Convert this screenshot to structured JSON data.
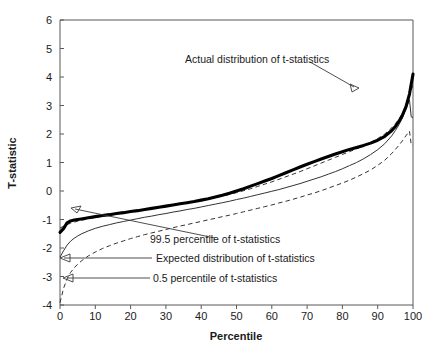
{
  "chart_data": {
    "type": "line",
    "title": "",
    "xlabel": "Percentile",
    "ylabel": "T-statistic",
    "xlim": [
      0,
      100
    ],
    "ylim": [
      -4,
      6
    ],
    "xticks": [
      "0",
      "10",
      "20",
      "30",
      "40",
      "50",
      "60",
      "70",
      "80",
      "90",
      "100"
    ],
    "yticks": [
      "6",
      "5",
      "4",
      "3",
      "2",
      "1",
      "0",
      "-1",
      "-2",
      "-3",
      "-4"
    ],
    "grid": false,
    "legend_position": "inline-annotations",
    "x": [
      0,
      1,
      2,
      3,
      4,
      5,
      6,
      8,
      10,
      12,
      14,
      16,
      18,
      20,
      22,
      24,
      26,
      28,
      30,
      32,
      34,
      36,
      38,
      40,
      42,
      44,
      46,
      48,
      50,
      52,
      54,
      56,
      58,
      60,
      62,
      64,
      66,
      68,
      70,
      72,
      74,
      76,
      78,
      80,
      82,
      84,
      86,
      88,
      90,
      92,
      94,
      95,
      96,
      97,
      98,
      99,
      99.5,
      100
    ],
    "series": [
      {
        "name": "Actual distribution of t-statistics",
        "style": "thick-solid",
        "color": "#000000",
        "values": [
          -1.45,
          -1.32,
          -1.12,
          -1.05,
          -1.02,
          -1.0,
          -0.98,
          -0.94,
          -0.9,
          -0.86,
          -0.83,
          -0.79,
          -0.76,
          -0.72,
          -0.69,
          -0.65,
          -0.61,
          -0.57,
          -0.53,
          -0.49,
          -0.45,
          -0.41,
          -0.37,
          -0.32,
          -0.27,
          -0.21,
          -0.15,
          -0.08,
          0.0,
          0.08,
          0.17,
          0.26,
          0.35,
          0.44,
          0.54,
          0.64,
          0.74,
          0.84,
          0.94,
          1.03,
          1.12,
          1.21,
          1.3,
          1.38,
          1.46,
          1.53,
          1.6,
          1.68,
          1.78,
          1.92,
          2.12,
          2.26,
          2.44,
          2.66,
          2.95,
          3.4,
          3.75,
          4.1
        ]
      },
      {
        "name": "99.5 percentile of t-statistics",
        "style": "dashed",
        "color": "#333333",
        "values": [
          -1.3,
          -1.24,
          -1.18,
          -1.13,
          -1.09,
          -1.06,
          -1.03,
          -0.98,
          -0.93,
          -0.89,
          -0.85,
          -0.81,
          -0.77,
          -0.73,
          -0.69,
          -0.65,
          -0.61,
          -0.57,
          -0.53,
          -0.49,
          -0.45,
          -0.41,
          -0.37,
          -0.33,
          -0.28,
          -0.23,
          -0.18,
          -0.12,
          -0.06,
          0.01,
          0.08,
          0.16,
          0.24,
          0.32,
          0.41,
          0.5,
          0.59,
          0.68,
          0.78,
          0.88,
          0.98,
          1.08,
          1.18,
          1.28,
          1.38,
          1.48,
          1.58,
          1.7,
          1.84,
          2.0,
          2.22,
          2.36,
          2.52,
          2.72,
          2.98,
          3.32,
          3.55,
          3.72
        ]
      },
      {
        "name": "Expected distribution of t-statistics",
        "style": "thin-solid",
        "color": "#333333",
        "values": [
          -2.32,
          -2.1,
          -1.9,
          -1.76,
          -1.66,
          -1.58,
          -1.51,
          -1.4,
          -1.31,
          -1.24,
          -1.18,
          -1.12,
          -1.07,
          -1.02,
          -0.97,
          -0.92,
          -0.88,
          -0.83,
          -0.79,
          -0.74,
          -0.7,
          -0.65,
          -0.61,
          -0.56,
          -0.51,
          -0.46,
          -0.41,
          -0.36,
          -0.3,
          -0.25,
          -0.19,
          -0.13,
          -0.07,
          -0.01,
          0.05,
          0.12,
          0.19,
          0.26,
          0.34,
          0.42,
          0.5,
          0.59,
          0.68,
          0.78,
          0.89,
          1.0,
          1.13,
          1.28,
          1.45,
          1.66,
          1.94,
          2.12,
          2.32,
          2.56,
          2.88,
          3.2,
          2.6,
          2.58
        ]
      },
      {
        "name": "0.5 percentile of t-statistics",
        "style": "dashed",
        "color": "#333333",
        "values": [
          -3.92,
          -3.42,
          -3.08,
          -2.86,
          -2.7,
          -2.57,
          -2.46,
          -2.28,
          -2.14,
          -2.02,
          -1.92,
          -1.83,
          -1.75,
          -1.67,
          -1.6,
          -1.53,
          -1.47,
          -1.41,
          -1.35,
          -1.29,
          -1.23,
          -1.18,
          -1.12,
          -1.07,
          -1.01,
          -0.96,
          -0.9,
          -0.85,
          -0.79,
          -0.73,
          -0.67,
          -0.61,
          -0.55,
          -0.49,
          -0.42,
          -0.36,
          -0.29,
          -0.22,
          -0.14,
          -0.07,
          0.01,
          0.1,
          0.19,
          0.28,
          0.38,
          0.49,
          0.61,
          0.74,
          0.9,
          1.08,
          1.32,
          1.46,
          1.6,
          1.76,
          1.94,
          2.1,
          1.62,
          1.6
        ]
      }
    ],
    "annotations": [
      {
        "id": "actual",
        "text": "Actual distribution of t-statistics"
      },
      {
        "id": "p995",
        "text": "99.5 percentile of t-statistics"
      },
      {
        "id": "expected",
        "text": "Expected distribution of t-statistics"
      },
      {
        "id": "p05",
        "text": "0.5 percentile of t-statistics"
      }
    ]
  }
}
